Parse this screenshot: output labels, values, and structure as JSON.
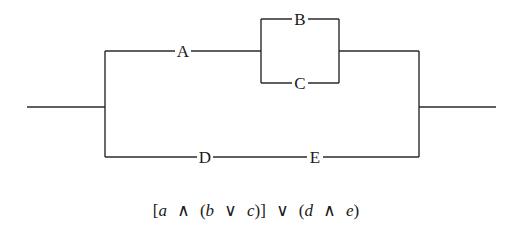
{
  "diagram": {
    "type": "switching-circuit",
    "switches": {
      "A": "A",
      "B": "B",
      "C": "C",
      "D": "D",
      "E": "E"
    },
    "formula": {
      "tokens": [
        "[",
        "a",
        "∧",
        "(",
        "b",
        "∨",
        "c",
        ")]",
        "∨",
        "(",
        "d",
        "∧",
        "e",
        ")"
      ],
      "text": "[a ∧ (b ∨ c)] ∨ (d ∧ e)"
    },
    "line_color": "#2a2a2a",
    "background": "#ffffff"
  }
}
